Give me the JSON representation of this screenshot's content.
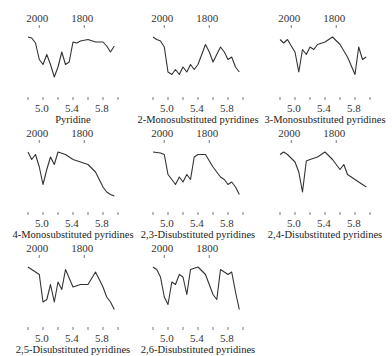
{
  "figure": {
    "top_axis_labels": [
      "2000",
      "1800"
    ],
    "bottom_axis_labels": [
      "5.0",
      "5.4",
      "5.8"
    ],
    "top_axis_unit_implied": "wavenumber (cm-1)",
    "bottom_axis_unit_implied": "wavelength (µm)",
    "line_color": "#333333",
    "panels": [
      {
        "caption": "Pyridine"
      },
      {
        "caption": "2-Monosubstituted pyridines"
      },
      {
        "caption": "3-Monosubstituted pyridines"
      },
      {
        "caption": "4-Monosubstituted pyridines"
      },
      {
        "caption": "2,3-Disubstituted pyridines"
      },
      {
        "caption": "2,4-Disubstituted pyridines"
      },
      {
        "caption": "2,5-Disubstituted pyridines"
      },
      {
        "caption": "2,6-Disubstituted pyridines"
      }
    ]
  },
  "chart_data": [
    {
      "type": "line",
      "title": "Pyridine",
      "x_ticks_bottom": [
        4.8,
        5.0,
        5.2,
        5.4,
        5.6,
        5.8,
        6.0
      ],
      "x_labels_bottom": [
        "5.0",
        "5.4",
        "5.8"
      ],
      "x_labels_top": [
        "2000",
        "1800"
      ],
      "x": [
        4.8,
        4.85,
        4.9,
        4.95,
        5.0,
        5.05,
        5.1,
        5.15,
        5.2,
        5.25,
        5.3,
        5.35,
        5.4,
        5.45,
        5.5,
        5.6,
        5.7,
        5.8,
        5.85,
        5.9,
        5.95
      ],
      "relative_transmittance": [
        0.9,
        0.88,
        0.78,
        0.45,
        0.35,
        0.55,
        0.35,
        0.1,
        0.3,
        0.6,
        0.35,
        0.4,
        0.8,
        0.78,
        0.82,
        0.85,
        0.8,
        0.8,
        0.72,
        0.6,
        0.72
      ]
    },
    {
      "type": "line",
      "title": "2-Monosubstituted pyridines",
      "x": [
        4.8,
        4.85,
        4.9,
        4.95,
        5.0,
        5.05,
        5.1,
        5.15,
        5.2,
        5.25,
        5.3,
        5.35,
        5.4,
        5.5,
        5.55,
        5.6,
        5.7,
        5.75,
        5.8,
        5.85,
        5.9,
        5.95
      ],
      "relative_transmittance": [
        0.9,
        0.85,
        0.82,
        0.7,
        0.2,
        0.15,
        0.25,
        0.15,
        0.3,
        0.2,
        0.35,
        0.25,
        0.35,
        0.75,
        0.6,
        0.4,
        0.7,
        0.6,
        0.45,
        0.5,
        0.3,
        0.2
      ]
    },
    {
      "type": "line",
      "title": "3-Monosubstituted pyridines",
      "x": [
        4.8,
        4.85,
        4.9,
        4.95,
        5.0,
        5.05,
        5.1,
        5.15,
        5.2,
        5.25,
        5.3,
        5.4,
        5.5,
        5.6,
        5.7,
        5.8,
        5.85,
        5.9,
        5.95
      ],
      "relative_transmittance": [
        0.85,
        0.78,
        0.85,
        0.72,
        0.6,
        0.2,
        0.65,
        0.55,
        0.7,
        0.65,
        0.75,
        0.8,
        0.9,
        0.75,
        0.5,
        0.15,
        0.7,
        0.45,
        0.5
      ]
    },
    {
      "type": "line",
      "title": "4-Monosubstituted pyridines",
      "x": [
        4.8,
        4.85,
        4.9,
        4.95,
        5.0,
        5.05,
        5.1,
        5.15,
        5.2,
        5.3,
        5.4,
        5.5,
        5.6,
        5.7,
        5.8,
        5.85,
        5.9,
        5.95
      ],
      "relative_transmittance": [
        0.9,
        0.75,
        0.85,
        0.6,
        0.25,
        0.55,
        0.8,
        0.65,
        0.9,
        0.85,
        0.75,
        0.7,
        0.65,
        0.5,
        0.2,
        0.1,
        0.05,
        0.02
      ]
    },
    {
      "type": "line",
      "title": "2,3-Disubstituted pyridines",
      "x": [
        4.8,
        4.9,
        4.95,
        5.0,
        5.05,
        5.1,
        5.15,
        5.2,
        5.25,
        5.3,
        5.35,
        5.4,
        5.5,
        5.6,
        5.7,
        5.75,
        5.8,
        5.85,
        5.9,
        5.95
      ],
      "relative_transmittance": [
        0.9,
        0.88,
        0.85,
        0.45,
        0.35,
        0.25,
        0.4,
        0.3,
        0.45,
        0.35,
        0.8,
        0.85,
        0.85,
        0.6,
        0.4,
        0.35,
        0.25,
        0.3,
        0.2,
        0.05
      ]
    },
    {
      "type": "line",
      "title": "2,4-Disubstituted pyridines",
      "x": [
        4.8,
        4.85,
        4.9,
        5.0,
        5.05,
        5.1,
        5.15,
        5.2,
        5.3,
        5.4,
        5.5,
        5.6,
        5.65,
        5.7,
        5.75,
        5.8,
        5.85,
        5.9,
        5.95
      ],
      "relative_transmittance": [
        0.85,
        0.9,
        0.85,
        0.7,
        0.5,
        0.1,
        0.72,
        0.75,
        0.8,
        0.9,
        0.75,
        0.55,
        0.65,
        0.45,
        0.4,
        0.35,
        0.3,
        0.25,
        0.2
      ]
    },
    {
      "type": "line",
      "title": "2,5-Disubstituted pyridines",
      "x": [
        4.8,
        4.85,
        4.9,
        4.95,
        5.0,
        5.05,
        5.1,
        5.15,
        5.2,
        5.25,
        5.3,
        5.4,
        5.5,
        5.6,
        5.7,
        5.75,
        5.8,
        5.85,
        5.9,
        5.95
      ],
      "relative_transmittance": [
        0.9,
        0.85,
        0.8,
        0.75,
        0.2,
        0.25,
        0.55,
        0.2,
        0.6,
        0.45,
        0.85,
        0.5,
        0.55,
        0.55,
        0.8,
        0.65,
        0.5,
        0.3,
        0.2,
        0.05
      ]
    },
    {
      "type": "line",
      "title": "2,6-Disubstituted pyridines",
      "x": [
        4.8,
        4.85,
        4.9,
        4.95,
        5.0,
        5.05,
        5.1,
        5.15,
        5.2,
        5.25,
        5.3,
        5.4,
        5.5,
        5.6,
        5.65,
        5.7,
        5.8,
        5.85,
        5.9,
        5.95
      ],
      "relative_transmittance": [
        0.9,
        0.85,
        0.7,
        0.3,
        0.15,
        0.6,
        0.55,
        0.75,
        0.7,
        0.35,
        0.85,
        0.9,
        0.75,
        0.35,
        0.25,
        0.85,
        0.75,
        0.8,
        0.4,
        0.05
      ]
    }
  ]
}
